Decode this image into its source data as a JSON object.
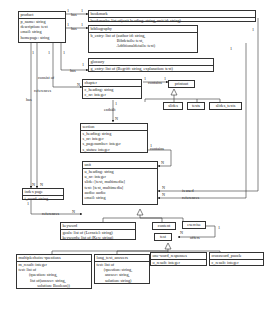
{
  "entities": {
    "product": {
      "name": "product",
      "attrs": "p_name: string\ndescription: text\nemail: string\nhomepage: string"
    },
    "bookmark": {
      "name": "bookmark",
      "attrs": "bookmarks: list of(unit heading: string, unit id: string)"
    },
    "bibliography": {
      "name": "bibliography",
      "attrs": "b_entry: list of (author id: string,\n                         Bibdetails: text,\n                         Additionaldetails: text)"
    },
    "glossary": {
      "name": "glossary",
      "attrs": "g_entry: list of (Begriff: string, explanation: text)"
    },
    "chapter": {
      "name": "chapter",
      "attrs": "c_heading: string\nc_nr: integer"
    },
    "printout": {
      "name": "printout"
    },
    "slides": {
      "name": "slides"
    },
    "texts": {
      "name": "texts"
    },
    "slides_texts": {
      "name": "slides_texts"
    },
    "section": {
      "name": "section",
      "attrs": "s_heading: string\ns_nr: integer\ns_pagenumber: integer\ns_status: integer"
    },
    "index_page": {
      "name": "index page",
      "attrs": "i_word: string"
    },
    "unit": {
      "name": "unit",
      "attrs": "u_heading: string\nu_nr: integer\nslide: [text, multimedia]\ntext: [text, multimedia]\naudio: audio\nemail: string"
    },
    "keyword": {
      "name": "keyword",
      "attrs": "goals: list of (Lernziel: string)\nkeywords: list of (Key: string)"
    },
    "content": {
      "name": "content"
    },
    "exercise": {
      "name": "exercise"
    },
    "test": {
      "name": "test"
    },
    "multiplechoice": {
      "name": "multiplechoice-questions",
      "attrs": "m_result: integer\ntest: list of\n          (question: string,\n           list of(answer: string,\n                  solution: Boolean))"
    },
    "long_text": {
      "name": "long_text_answers",
      "attrs": "test: list of\n       (question: string,\n        answer: string,\n        solution: string)"
    },
    "one_word": {
      "name": "one-word_responses",
      "attrs": "o_result: integer"
    },
    "crossword": {
      "name": "crossword_puzzle",
      "attrs": "c_result: integer"
    }
  },
  "relations": {
    "has": "has",
    "consist_of": "consist of",
    "references": "references",
    "contains": "contains",
    "enthaelt": "enthält",
    "is_used": "is used",
    "offers": "offers",
    "one": "1",
    "n": "N"
  }
}
